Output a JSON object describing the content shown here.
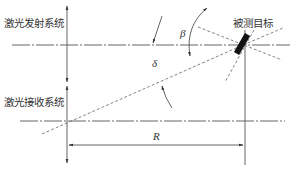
{
  "diagram": {
    "labels": {
      "emitter": "激光发射系统",
      "receiver": "激光接收系统",
      "target": "被测目标",
      "beta": "β",
      "delta": "δ",
      "distance": "R"
    },
    "colors": {
      "line": "#555555",
      "text": "#333333",
      "target": "#111111",
      "background": "#ffffff"
    }
  }
}
